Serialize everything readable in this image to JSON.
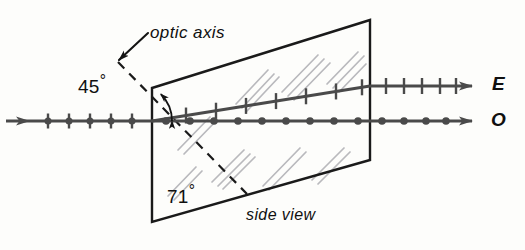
{
  "figure": {
    "title": "side view",
    "canvas": {
      "width": 525,
      "height": 250
    },
    "background_color": "#fdfdfb",
    "ink_color": "#1a1a1a",
    "ray_color": "#4a4a4a",
    "glint_color": "#b9b9bd"
  },
  "labels": {
    "optic_axis": "optic axis",
    "side_view": "side view",
    "angle_incidence": "45",
    "angle_rhomb": "71",
    "degree_symbol": "°",
    "ray_e": "E",
    "ray_o": "O"
  },
  "annotations": {
    "optic_axis_leader": {
      "name": "leader-arrow-optic-axis",
      "from": [
        148,
        33
      ],
      "to": [
        119,
        60
      ],
      "style": "solid-arrow"
    },
    "angle_arc_45": {
      "name": "angle-arc-45",
      "vertex": [
        134,
        121
      ],
      "from_deg": 0,
      "to_deg": 45,
      "radius": 38,
      "arrowheads": "both"
    }
  },
  "crystal": {
    "name": "calcite-rhomb",
    "shape": "parallelogram",
    "corners": {
      "top_left": [
        152,
        88
      ],
      "top_right": [
        370,
        20
      ],
      "bottom_right": [
        370,
        160
      ],
      "bottom_left": [
        152,
        222
      ]
    },
    "stroke_width": 2.4,
    "fill": "none",
    "interior_angle_bottom_left": "71",
    "glints": [
      {
        "x1": 168,
        "y1": 196,
        "x2": 196,
        "y2": 167
      },
      {
        "x1": 174,
        "y1": 200,
        "x2": 202,
        "y2": 171
      },
      {
        "x1": 178,
        "y1": 150,
        "x2": 210,
        "y2": 117
      },
      {
        "x1": 184,
        "y1": 154,
        "x2": 216,
        "y2": 121
      },
      {
        "x1": 212,
        "y1": 182,
        "x2": 244,
        "y2": 150
      },
      {
        "x1": 218,
        "y1": 186,
        "x2": 250,
        "y2": 154
      },
      {
        "x1": 223,
        "y1": 189,
        "x2": 255,
        "y2": 157
      },
      {
        "x1": 236,
        "y1": 104,
        "x2": 268,
        "y2": 70
      },
      {
        "x1": 242,
        "y1": 108,
        "x2": 274,
        "y2": 74
      },
      {
        "x1": 247,
        "y1": 111,
        "x2": 279,
        "y2": 77
      },
      {
        "x1": 263,
        "y1": 186,
        "x2": 300,
        "y2": 148
      },
      {
        "x1": 269,
        "y1": 190,
        "x2": 306,
        "y2": 152
      },
      {
        "x1": 282,
        "y1": 92,
        "x2": 318,
        "y2": 55
      },
      {
        "x1": 288,
        "y1": 96,
        "x2": 324,
        "y2": 59
      },
      {
        "x1": 294,
        "y1": 100,
        "x2": 330,
        "y2": 63
      },
      {
        "x1": 312,
        "y1": 180,
        "x2": 344,
        "y2": 148
      },
      {
        "x1": 318,
        "y1": 184,
        "x2": 350,
        "y2": 152
      },
      {
        "x1": 327,
        "y1": 84,
        "x2": 358,
        "y2": 52
      },
      {
        "x1": 333,
        "y1": 88,
        "x2": 364,
        "y2": 56
      },
      {
        "x1": 339,
        "y1": 92,
        "x2": 366,
        "y2": 64
      }
    ]
  },
  "optic_axis_line": {
    "name": "optic-axis-dashed-line",
    "from": [
      118,
      62
    ],
    "to": [
      247,
      194
    ],
    "dash": "9 7",
    "stroke_width": 2.2,
    "angle_to_horizontal_deg": 45
  },
  "rays": {
    "incident": {
      "name": "incident-ray",
      "polarization": "unpolarized",
      "marker": "dot-and-tick",
      "y": 121,
      "x_start": 6,
      "x_end": 152,
      "arrow_x": 30,
      "markers_x": [
        48,
        69,
        90,
        111,
        132
      ]
    },
    "extraordinary": {
      "name": "extraordinary-ray",
      "polarization": "in-plane",
      "marker": "tick",
      "label": "E",
      "inside": {
        "x1": 152,
        "y1": 121,
        "x2": 370,
        "y2": 86
      },
      "outside": {
        "x1": 370,
        "y1": 86,
        "x2": 472,
        "y2": 86
      },
      "ticks_inside_x": [
        186,
        216,
        246,
        276,
        306,
        336,
        362
      ],
      "ticks_outside_x": [
        386,
        404,
        422,
        440,
        456
      ]
    },
    "ordinary": {
      "name": "ordinary-ray",
      "polarization": "perpendicular",
      "marker": "dot",
      "label": "O",
      "y": 121,
      "x_start": 152,
      "x_end": 472,
      "dots_x": [
        166,
        190,
        214,
        238,
        262,
        286,
        310,
        334,
        358,
        382,
        404,
        426,
        446
      ]
    }
  }
}
